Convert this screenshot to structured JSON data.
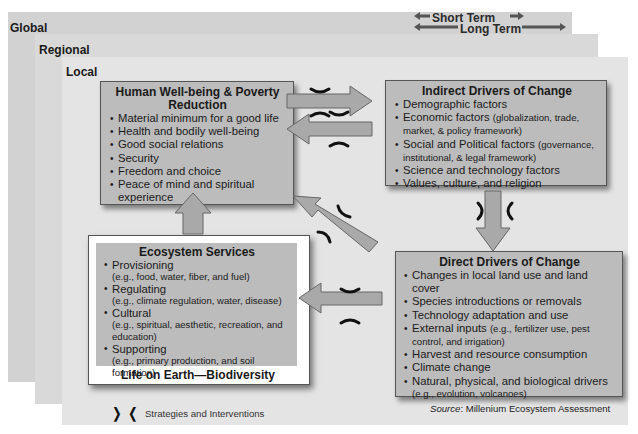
{
  "scales": {
    "global": "Global",
    "regional": "Regional",
    "local": "Local"
  },
  "time_terms": {
    "short": "Short Term",
    "long": "Long Term"
  },
  "human_wellbeing": {
    "title_line1": "Human Well-being & Poverty",
    "title_line2": "Reduction",
    "items": [
      "Material minimum for a good life",
      "Health and bodily well-being",
      "Good social relations",
      "Security",
      "Freedom and choice",
      "Peace of mind and spiritual experience"
    ]
  },
  "indirect_drivers": {
    "title": "Indirect Drivers of Change",
    "items": [
      {
        "main": "Demographic factors",
        "detail": ""
      },
      {
        "main": "Economic factors",
        "detail": "(globalization, trade, market, & policy framework)"
      },
      {
        "main": "Social and Political factors",
        "detail": "(governance, institutional, & legal framework)"
      },
      {
        "main": "Science and technology factors",
        "detail": ""
      },
      {
        "main": "Values, culture, and religion",
        "detail": ""
      }
    ]
  },
  "direct_drivers": {
    "title": "Direct Drivers of Change",
    "items": [
      {
        "main": "Changes in local land use and land cover",
        "detail": ""
      },
      {
        "main": "Species introductions or removals",
        "detail": ""
      },
      {
        "main": "Technology adaptation and use",
        "detail": ""
      },
      {
        "main": "External inputs",
        "detail": "(e.g., fertilizer use, pest control, and irrigation)"
      },
      {
        "main": "Harvest and resource consumption",
        "detail": ""
      },
      {
        "main": "Climate change",
        "detail": ""
      },
      {
        "main": "Natural, physical, and biological drivers",
        "detail": "(e.g., evolution, volcanoes)"
      }
    ]
  },
  "ecosystem_services": {
    "title": "Ecosystem Services",
    "items": [
      {
        "main": "Provisioning",
        "detail": "(e.g., food, water, fiber, and fuel)"
      },
      {
        "main": "Regulating",
        "detail": "(e.g., climate regulation, water, disease)"
      },
      {
        "main": "Cultural",
        "detail": "(e.g., spiritual, aesthetic, recreation, and education)"
      },
      {
        "main": "Supporting",
        "detail": "(e.g., primary production, and soil formation)"
      }
    ],
    "footer": "Life on Earth—Biodiversity"
  },
  "legend": {
    "glyph": "❭ ❬",
    "label": "Strategies and Interventions"
  },
  "source": {
    "prefix": "Source",
    "text": ": Millenium Ecosystem Assessment"
  },
  "colors": {
    "box_fill": "#bcbcbc",
    "arrow_fill": "#a9a9a9",
    "global_bg": "#d2d2d2",
    "regional_bg": "#d9d9d9",
    "local_bg": "#e4e4e4"
  }
}
